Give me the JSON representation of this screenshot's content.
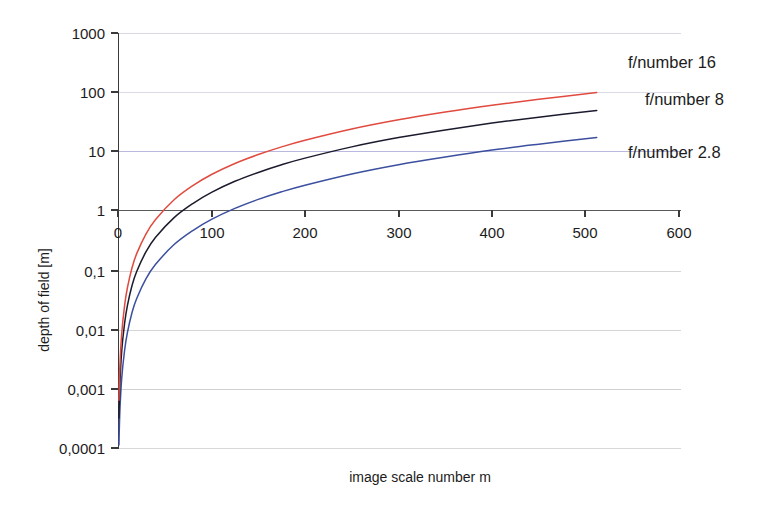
{
  "chart_data": {
    "type": "line",
    "title": "",
    "xlabel": "image scale number m",
    "ylabel": "depth of field [m]",
    "xlim": [
      0,
      600
    ],
    "ylim": [
      0.0001,
      1000
    ],
    "yscale": "log",
    "xscale": "linear",
    "grid": true,
    "legend_position": "right-inline",
    "x_ticks": [
      "0",
      "100",
      "200",
      "300",
      "400",
      "500",
      "600"
    ],
    "x_tick_values": [
      0,
      100,
      200,
      300,
      400,
      500,
      600
    ],
    "y_ticks": [
      "1000",
      "100",
      "10",
      "1",
      "0,1",
      "0,01",
      "0,001",
      "0,0001"
    ],
    "y_tick_values": [
      1000,
      100,
      10,
      1,
      0.1,
      0.01,
      0.001,
      0.0001
    ],
    "series": [
      {
        "name": "f/number 16",
        "color": "#e04a3f",
        "f_number": 16,
        "x": [
          1,
          2,
          4,
          7,
          10,
          15,
          20,
          30,
          40,
          60,
          80,
          100,
          125,
          150,
          175,
          200,
          250,
          300,
          350,
          400,
          450,
          512
        ],
        "y": [
          0.00064,
          0.0024,
          0.0087,
          0.025,
          0.05,
          0.11,
          0.19,
          0.41,
          0.71,
          1.54,
          2.66,
          4.1,
          6.3,
          8.9,
          12.0,
          15.5,
          24.0,
          34.3,
          46.4,
          60.3,
          76.0,
          99.0
        ]
      },
      {
        "name": "f/number 8",
        "color": "#1b1b2e",
        "f_number": 8,
        "x": [
          1,
          2,
          4,
          7,
          10,
          15,
          20,
          30,
          40,
          60,
          80,
          100,
          125,
          150,
          175,
          200,
          250,
          300,
          350,
          400,
          450,
          512
        ],
        "y": [
          0.00032,
          0.0012,
          0.0044,
          0.0125,
          0.025,
          0.055,
          0.095,
          0.205,
          0.355,
          0.77,
          1.33,
          2.05,
          3.15,
          4.45,
          6.0,
          7.75,
          12.0,
          17.2,
          23.2,
          30.2,
          38.0,
          49.5
        ]
      },
      {
        "name": "f/number 2.8",
        "color": "#3b4f9e",
        "f_number": 2.8,
        "x": [
          1,
          2,
          4,
          7,
          10,
          15,
          20,
          30,
          40,
          60,
          80,
          100,
          125,
          150,
          175,
          200,
          250,
          300,
          350,
          400,
          450,
          512
        ],
        "y": [
          0.000112,
          0.00042,
          0.00152,
          0.00437,
          0.00875,
          0.0193,
          0.0333,
          0.0718,
          0.124,
          0.27,
          0.466,
          0.718,
          1.1,
          1.56,
          2.1,
          2.71,
          4.2,
          6.02,
          8.12,
          10.6,
          13.3,
          17.3
        ]
      }
    ],
    "annotations": [
      {
        "text": "f/number 16",
        "x_px": 628,
        "y_px": 62
      },
      {
        "text": "f/number 8",
        "x_px": 645,
        "y_px": 99
      },
      {
        "text": "f/number 2.8",
        "x_px": 628,
        "y_px": 152
      }
    ],
    "grid_colors": {
      "gridline_1000": "#d9d9e3",
      "gridline_100": "#dcdce8",
      "gridline_10": "#b9b9e0",
      "gridline_1": "#5a5a5a",
      "gridline_0_1": "#d5d5d5",
      "gridline_0_01": "#d5d5d5",
      "gridline_0_001": "#d0d0d0",
      "gridline_0_0001": "#d8d8d8"
    }
  },
  "axes": {
    "y_title": "depth of field [m]",
    "x_title": "image scale number m",
    "y_labels": [
      "1000",
      "100",
      "10",
      "1",
      "0,1",
      "0,01",
      "0,001",
      "0,0001"
    ],
    "x_labels": [
      "0",
      "100",
      "200",
      "300",
      "400",
      "500",
      "600"
    ]
  },
  "series_labels": {
    "f16": "f/number 16",
    "f8": "f/number 8",
    "f28": "f/number 2.8"
  }
}
